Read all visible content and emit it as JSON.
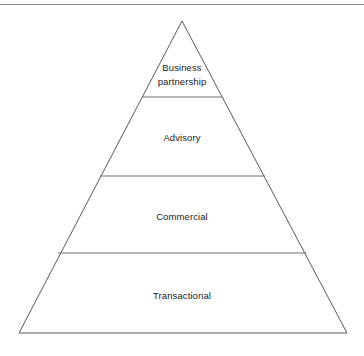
{
  "figure": {
    "type": "pyramid-diagram",
    "title": "",
    "background_color": "#ffffff",
    "stroke_color": "#5a5a5a",
    "text_color": "#1b1b1b",
    "top_rule_color": "#8d8d8d"
  },
  "pyramid": {
    "apex": {
      "x": 182,
      "y": 21
    },
    "base_left": {
      "x": 19,
      "y": 333
    },
    "base_right": {
      "x": 347,
      "y": 333
    },
    "tier_count": 4,
    "tiers": [
      {
        "label": "Business\npartnership",
        "label_plain": "Business partnership",
        "level": 1,
        "position": "top",
        "divider_y": 97,
        "divider_x_start": 143,
        "divider_x_end": 222
      },
      {
        "label": "Advisory",
        "label_plain": "Advisory",
        "level": 2,
        "position": "upper-middle",
        "divider_y": 176,
        "divider_x_start": 100,
        "divider_x_end": 265
      },
      {
        "label": "Commercial",
        "label_plain": "Commercial",
        "level": 3,
        "position": "lower-middle",
        "divider_y": 253,
        "divider_x_start": 58,
        "divider_x_end": 306
      },
      {
        "label": "Transactional",
        "label_plain": "Transactional",
        "level": 4,
        "position": "base",
        "divider_y": null,
        "divider_x_start": null,
        "divider_x_end": null
      }
    ]
  }
}
